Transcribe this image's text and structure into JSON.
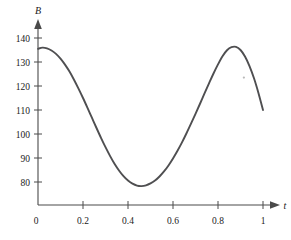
{
  "chart_data": {
    "type": "line",
    "title": "",
    "subtitle": "",
    "xlabel": "t",
    "ylabel": "B",
    "xlim": [
      0,
      1.04
    ],
    "ylim": [
      70,
      145
    ],
    "grid": false,
    "legend": null,
    "x_ticks": [
      {
        "value": 0,
        "label": "0"
      },
      {
        "value": 0.2,
        "label": "0.2"
      },
      {
        "value": 0.4,
        "label": "0.4"
      },
      {
        "value": 0.6,
        "label": "0.6"
      },
      {
        "value": 0.8,
        "label": "0.8"
      },
      {
        "value": 1,
        "label": "1"
      }
    ],
    "y_ticks": [
      {
        "value": 80,
        "label": "80"
      },
      {
        "value": 90,
        "label": "90"
      },
      {
        "value": 100,
        "label": "100"
      },
      {
        "value": 110,
        "label": "110"
      },
      {
        "value": 120,
        "label": "120"
      },
      {
        "value": 130,
        "label": "130"
      },
      {
        "value": 140,
        "label": "140"
      }
    ],
    "origin_label": "0",
    "axis_arrows": {
      "x": true,
      "y": true
    },
    "series": [
      {
        "name": "B(t)",
        "color": "#4f4f51",
        "x": [
          0.0,
          0.02,
          0.04,
          0.06,
          0.08,
          0.1,
          0.12,
          0.14,
          0.16,
          0.18,
          0.2,
          0.22,
          0.24,
          0.26,
          0.28,
          0.3,
          0.32,
          0.34,
          0.36,
          0.38,
          0.4,
          0.42,
          0.44,
          0.46,
          0.48,
          0.5,
          0.52,
          0.54,
          0.56,
          0.58,
          0.6,
          0.62,
          0.64,
          0.66,
          0.68,
          0.7,
          0.72,
          0.74,
          0.76,
          0.78,
          0.8,
          0.82,
          0.84,
          0.86,
          0.88,
          0.9,
          0.92,
          0.94,
          0.96,
          0.98,
          1.0
        ],
        "y": [
          135.5,
          136.0,
          135.7,
          134.8,
          133.4,
          131.4,
          128.9,
          126.0,
          122.6,
          118.9,
          115.0,
          110.9,
          106.7,
          102.5,
          98.4,
          94.5,
          90.9,
          87.6,
          84.8,
          82.4,
          80.6,
          79.3,
          78.5,
          78.3,
          78.6,
          79.4,
          80.6,
          82.3,
          84.4,
          86.9,
          89.8,
          93.0,
          96.5,
          100.3,
          104.3,
          108.4,
          112.6,
          116.9,
          121.1,
          125.2,
          129.0,
          132.4,
          134.9,
          136.2,
          136.3,
          135.0,
          132.3,
          128.3,
          123.2,
          117.0,
          110.0
        ]
      }
    ],
    "annotations": {
      "minimum": {
        "t": 0.46,
        "B": 78.3
      },
      "maximum_start": {
        "t": 0.02,
        "B": 136.0
      },
      "maximum_second": {
        "t": 0.88,
        "B": 136.3
      },
      "end_point": {
        "t": 1.0,
        "B": 93.0
      }
    },
    "speck": {
      "x": 0.915,
      "y": 123.5
    }
  }
}
